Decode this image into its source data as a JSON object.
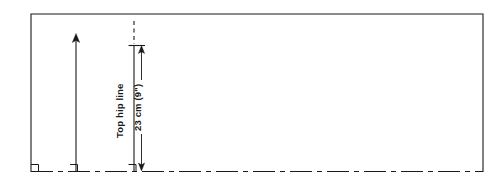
{
  "figure": {
    "background_color": "#ffffff",
    "line_color": "#1a1a1a",
    "width": 502,
    "height": 190
  },
  "labels": {
    "top_hip_line": "Top hip line",
    "measurement": "23 cm (9\")"
  },
  "annotations": [
    {
      "name": "top-hip-line-label",
      "text": "Top hip line",
      "orientation": "vertical-bottom-to-top"
    },
    {
      "name": "measurement-label",
      "text": "23 cm (9\")",
      "orientation": "vertical-bottom-to-top",
      "value": 23,
      "unit": "cm",
      "imperial": "9\""
    }
  ],
  "elements": {
    "outline_name": "pattern-outline-rectangle",
    "hem_line_name": "hem-line-dash-dot",
    "grain_arrow_name": "grain-line-arrow",
    "hip_guide_name": "top-hip-guide-dashed",
    "dimension_arrow_name": "hip-depth-dimension-arrow",
    "corner_marker_name": "right-angle-marker"
  }
}
